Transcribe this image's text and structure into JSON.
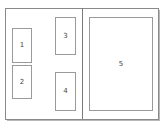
{
  "diagram": {
    "type": "page-layout-spread",
    "pages": [
      {
        "name": "left-page",
        "frames": [
          {
            "label": "1",
            "x": 12,
            "y": 28,
            "w": 20,
            "h": 35
          },
          {
            "label": "2",
            "x": 12,
            "y": 65,
            "w": 20,
            "h": 34
          },
          {
            "label": "3",
            "x": 55,
            "y": 17,
            "w": 21,
            "h": 38
          },
          {
            "label": "4",
            "x": 55,
            "y": 72,
            "w": 21,
            "h": 39
          }
        ]
      },
      {
        "name": "right-page",
        "frames": [
          {
            "label": "5",
            "x": 89,
            "y": 17,
            "w": 64,
            "h": 94
          }
        ]
      }
    ],
    "colors": {
      "page_border": "#8a8a8a",
      "frame_border": "#9a9a9a",
      "shadow": "#b8b8b8",
      "label": "#444444"
    }
  }
}
